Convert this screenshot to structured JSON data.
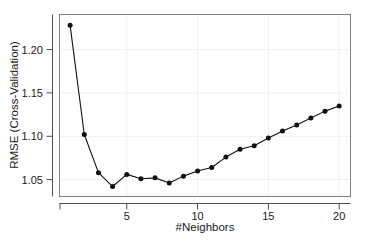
{
  "chart_data": {
    "type": "line",
    "title": "",
    "subtitle": "",
    "xlabel": "#Neighbors",
    "ylabel": "RMSE (Cross-Validation)",
    "x": [
      1,
      2,
      3,
      4,
      5,
      6,
      7,
      8,
      9,
      10,
      11,
      12,
      13,
      14,
      15,
      16,
      17,
      18,
      19,
      20
    ],
    "values": [
      1.228,
      1.102,
      1.058,
      1.042,
      1.056,
      1.051,
      1.052,
      1.046,
      1.054,
      1.06,
      1.064,
      1.076,
      1.085,
      1.089,
      1.098,
      1.106,
      1.113,
      1.121,
      1.129,
      1.135
    ],
    "series": [
      {
        "name": "RMSE (Cross-Validation)",
        "values": [
          1.228,
          1.102,
          1.058,
          1.042,
          1.056,
          1.051,
          1.052,
          1.046,
          1.054,
          1.06,
          1.064,
          1.076,
          1.085,
          1.089,
          1.098,
          1.106,
          1.113,
          1.121,
          1.129,
          1.135
        ]
      }
    ],
    "xlim": [
      0.25,
      20.8
    ],
    "ylim": [
      1.0305,
      1.2405
    ],
    "xticks": [
      5,
      10,
      15,
      20
    ],
    "xtick_labels": [
      "5",
      "10",
      "15",
      "20"
    ],
    "yticks": [
      1.05,
      1.1,
      1.15,
      1.2
    ],
    "ytick_labels": [
      "1.05",
      "1.10",
      "1.15",
      "1.20"
    ],
    "grid": true,
    "grid_color": "#f0f0f0",
    "legend": null,
    "legend_position": "none",
    "marker": "filled-circle",
    "marker_color": "#111111",
    "line_color": "#111111",
    "background": "#ffffff",
    "panel_border_color": "#808080",
    "annotations": []
  },
  "axes": {
    "x_title": "#Neighbors",
    "y_title": "RMSE (Cross-Validation)"
  }
}
